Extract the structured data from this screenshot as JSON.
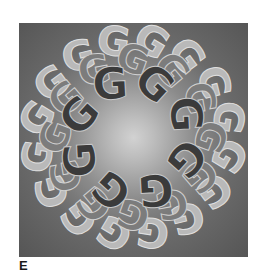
{
  "figure": {
    "panel_label": "E",
    "glyph": "G",
    "rings": [
      {
        "name": "outer-light",
        "count": 16,
        "radius": 98,
        "size": 40,
        "fill": "#b9b9b9",
        "stroke": "#dedede",
        "rotation_offset": 11
      },
      {
        "name": "middle",
        "count": 12,
        "radius": 78,
        "size": 40,
        "fill": "#7c7c7c",
        "stroke": "#d0d0d0",
        "rotation_offset": 0
      },
      {
        "name": "inner-dark",
        "count": 8,
        "radius": 58,
        "size": 44,
        "fill": "#3b3b3b",
        "stroke": "#c8c8c8",
        "rotation_offset": 22
      }
    ],
    "colors": {
      "background_center": "#d2d2d2",
      "background_edge": "#555555",
      "label": "#1a1a1a"
    }
  }
}
